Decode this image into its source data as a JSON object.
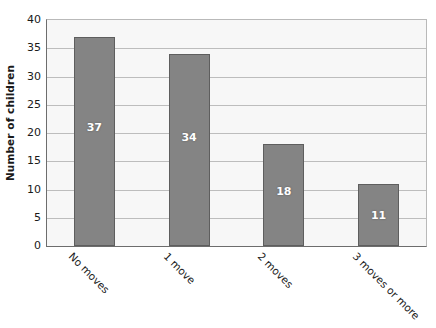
{
  "chart_data": {
    "type": "bar",
    "title": "",
    "subtitle": "",
    "xlabel": "",
    "ylabel": "Number of children",
    "categories": [
      "No moves",
      "1 move",
      "2 moves",
      "3 moves or more"
    ],
    "values": [
      37,
      34,
      18,
      11
    ],
    "data_labels": [
      "37",
      "34",
      "18",
      "11"
    ],
    "ylim": [
      0,
      40
    ],
    "ytick_labels": [
      "0",
      "5",
      "10",
      "15",
      "20",
      "25",
      "30",
      "35",
      "40"
    ],
    "ytick_values": [
      0,
      5,
      10,
      15,
      20,
      25,
      30,
      35,
      40
    ],
    "ytick_step": 5,
    "grid": "horizontal",
    "legend": "none",
    "legend_position": "none",
    "bar_color": "#848484",
    "bar_border_color": "#5e5e5e",
    "data_label_color": "#ffffff",
    "plot_background": "#f7f7f7",
    "gridline_color": "#bdbdbd",
    "axis_color": "#6d6d6d",
    "xtick_label_rotation": 45
  }
}
